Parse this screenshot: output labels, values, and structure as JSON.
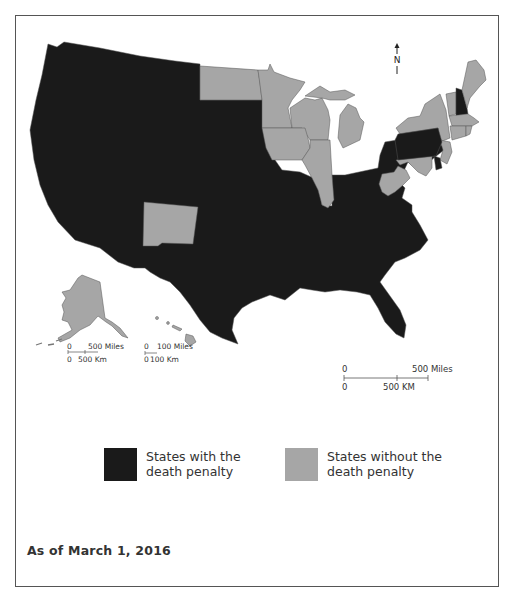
{
  "map": {
    "title": "U.S. states with and without the death penalty",
    "colors": {
      "with_death_penalty": "#1a1a1a",
      "without_death_penalty": "#a6a6a6",
      "state_border": "#555555",
      "frame": "#555555"
    },
    "north_arrow": {
      "label": "N"
    },
    "scale_bars": {
      "alaska": {
        "miles_zero": "0",
        "miles_label": "500 Miles",
        "km_zero": "0",
        "km_label": "500 Km"
      },
      "hawaii": {
        "miles_zero": "0",
        "miles_label": "100 Miles",
        "km_zero": "0",
        "km_label": "100 Km"
      },
      "mainland": {
        "miles_zero": "0",
        "miles_label": "500 Miles",
        "km_zero": "0",
        "km_label": "500 KM"
      }
    },
    "states_with_death_penalty": [
      "Washington",
      "Oregon",
      "California",
      "Idaho",
      "Nevada",
      "Utah",
      "Arizona",
      "Montana",
      "Wyoming",
      "Colorado",
      "South Dakota",
      "Nebraska",
      "Kansas",
      "Oklahoma",
      "Texas",
      "Missouri",
      "Arkansas",
      "Louisiana",
      "Mississippi",
      "Alabama",
      "Georgia",
      "Florida",
      "South Carolina",
      "North Carolina",
      "Tennessee",
      "Kentucky",
      "Indiana",
      "Ohio",
      "Virginia",
      "Pennsylvania",
      "New Hampshire",
      "Delaware"
    ],
    "states_without_death_penalty": [
      "North Dakota",
      "Minnesota",
      "Iowa",
      "Wisconsin",
      "Illinois",
      "Michigan",
      "New Mexico",
      "West Virginia",
      "Maryland",
      "New Jersey",
      "New York",
      "Vermont",
      "Maine",
      "Massachusetts",
      "Connecticut",
      "Rhode Island",
      "Alaska",
      "Hawaii"
    ],
    "legend": [
      {
        "key": "with",
        "label_line1": "States with the",
        "label_line2": "death penalty",
        "color": "#1a1a1a"
      },
      {
        "key": "without",
        "label_line1": "States without the",
        "label_line2": "death penalty",
        "color": "#a6a6a6"
      }
    ],
    "date_note": "As of March 1, 2016"
  }
}
